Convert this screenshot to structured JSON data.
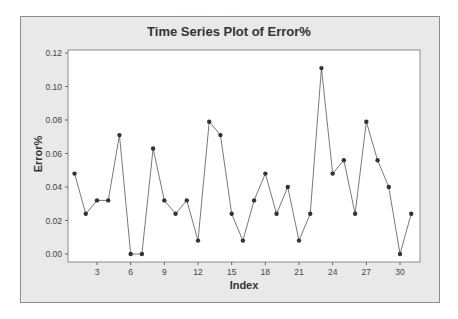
{
  "chart_data": {
    "type": "line",
    "title": "Time Series Plot of Error%",
    "xlabel": "Index",
    "ylabel": "Error%",
    "x": [
      1,
      2,
      3,
      4,
      5,
      6,
      7,
      8,
      9,
      10,
      11,
      12,
      13,
      14,
      15,
      16,
      17,
      18,
      19,
      20,
      21,
      22,
      23,
      24,
      25,
      26,
      27,
      28,
      29,
      30,
      31
    ],
    "values": [
      0.048,
      0.024,
      0.032,
      0.032,
      0.071,
      0.0,
      0.0,
      0.063,
      0.032,
      0.024,
      0.032,
      0.008,
      0.079,
      0.071,
      0.024,
      0.008,
      0.032,
      0.048,
      0.024,
      0.04,
      0.008,
      0.024,
      0.111,
      0.048,
      0.056,
      0.024,
      0.079,
      0.056,
      0.04,
      0.0,
      0.024
    ],
    "xticks": [
      3,
      6,
      9,
      12,
      15,
      18,
      21,
      24,
      27,
      30
    ],
    "yticks": [
      "0.00",
      "0.02",
      "0.04",
      "0.06",
      "0.08",
      "0.10",
      "0.12"
    ],
    "ylim": [
      0,
      0.12
    ],
    "xlim": [
      0,
      32
    ],
    "grid": false,
    "legend": null,
    "marker": "circle",
    "line_color": "#555555",
    "marker_color": "#333333"
  }
}
